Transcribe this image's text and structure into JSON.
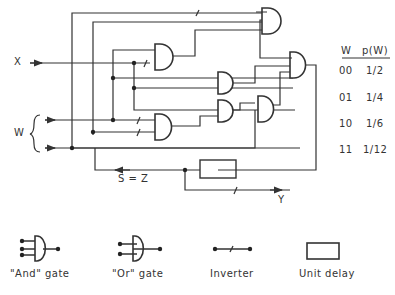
{
  "diagram": {
    "inputs": {
      "x_label": "X",
      "w_label": "W"
    },
    "feedback_label": "S = Z",
    "output_label": "Y"
  },
  "probability_table": {
    "headers": [
      "W",
      "p(W)"
    ],
    "rows": [
      {
        "w": "00",
        "p": "1/2"
      },
      {
        "w": "01",
        "p": "1/4"
      },
      {
        "w": "10",
        "p": "1/6"
      },
      {
        "w": "11",
        "p": "1/12"
      }
    ]
  },
  "legend": {
    "and_gate": "\"And\" gate",
    "or_gate": "\"Or\" gate",
    "inverter": "Inverter",
    "unit_delay": "Unit delay"
  },
  "colors": {
    "line": "#333333",
    "background": "#ffffff"
  }
}
